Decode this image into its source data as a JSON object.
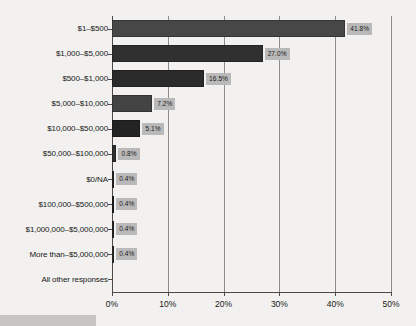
{
  "chart_data": {
    "type": "bar",
    "orientation": "horizontal",
    "title": "",
    "subtitle": "",
    "xlabel": "",
    "ylabel": "",
    "xlim": [
      0,
      50
    ],
    "grid": true,
    "legend": null,
    "categories": [
      "$1–$500",
      "$1,000–$5,000",
      "$500–$1,000",
      "$5,000–$10,000",
      "$10,000–$50,000",
      "$50,000–$100,000",
      "$0/NA",
      "$100,000–$500,000",
      "$1,000,000–$5,000,000",
      "More than–$5,000,000",
      "All other responses"
    ],
    "values": [
      41.8,
      27.0,
      16.5,
      7.2,
      5.1,
      0.8,
      0.4,
      0.4,
      0.4,
      0.4,
      0.0
    ],
    "data_labels": [
      "41.8%",
      "27.0%",
      "16.5%",
      "7.2%",
      "5.1%",
      "0.8%",
      "0.4%",
      "0.4%",
      "0.4%",
      "0.4%",
      ""
    ],
    "xticks": [
      0,
      10,
      20,
      30,
      40,
      50
    ],
    "xtick_labels": [
      "0%",
      "10%",
      "20%",
      "30%",
      "40%",
      "50%"
    ],
    "colors": {
      "background": "#f2f1ef",
      "bar": "#3a3a3a",
      "label_box": "#b9b9b9",
      "axis": "#4a4a4a",
      "gridline": "#8d8d8d",
      "text": "#181818",
      "caption_block": "#c6c5c3"
    }
  }
}
